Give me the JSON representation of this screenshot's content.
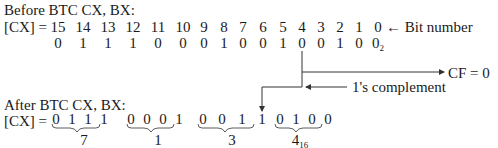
{
  "before": {
    "title": "Before BTC CX, BX:",
    "reg_label": "[CX] =",
    "bit_numbers": [
      "15",
      "14",
      "13",
      "12",
      "11",
      "10",
      "9",
      "8",
      "7",
      "6",
      "5",
      "4",
      "3",
      "2",
      "1",
      "0"
    ],
    "bit_number_label": "← Bit number",
    "bits": [
      "0",
      "1",
      "1",
      "1",
      "0",
      "0",
      "0",
      "1",
      "0",
      "0",
      "1",
      "0",
      "0",
      "1",
      "0",
      "0"
    ],
    "base_subscript": "2"
  },
  "annotations": {
    "cf": "CF = 0",
    "complement": "1's complement"
  },
  "after": {
    "title": "After BTC CX, BX:",
    "reg_label": "[CX] =",
    "groups": [
      {
        "bits": [
          "0",
          "1",
          "1",
          "1"
        ],
        "hex": "7"
      },
      {
        "bits": [
          "0",
          "0",
          "0",
          "1"
        ],
        "hex": "1"
      },
      {
        "bits": [
          "0",
          "0",
          "1",
          "1"
        ],
        "hex": "3"
      },
      {
        "bits": [
          "0",
          "1",
          "0",
          "0"
        ],
        "hex": "4"
      }
    ],
    "hex_subscript": "16"
  }
}
